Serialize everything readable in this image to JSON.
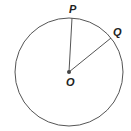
{
  "diagram": {
    "type": "circle-with-radii",
    "colors": {
      "stroke": "#555555",
      "label": "#222222",
      "background": "#ffffff"
    },
    "circle": {
      "cx": 69,
      "cy": 72,
      "r": 54
    },
    "center": {
      "label": "O",
      "x": 69,
      "y": 72
    },
    "points": [
      {
        "label": "P",
        "x": 72,
        "y": 18
      },
      {
        "label": "Q",
        "x": 111,
        "y": 38
      }
    ]
  }
}
